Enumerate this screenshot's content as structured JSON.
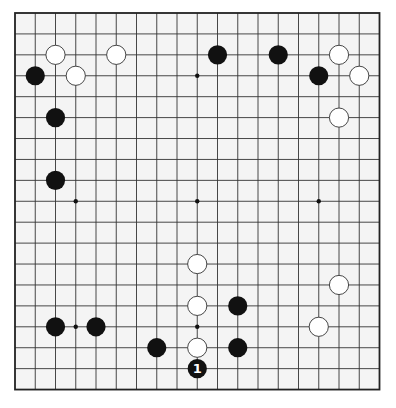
{
  "board": {
    "size": 19,
    "origin_x": 15,
    "origin_y": 13,
    "spacing_x": 20.25,
    "spacing_y": 20.92,
    "stone_radius": 9.6,
    "colors": {
      "background": "#f4f4f4",
      "line": "#333333",
      "border": "#222222",
      "black_stone": "#111111",
      "white_stone": "#ffffff",
      "white_outline": "#333333",
      "star_point": "#111111"
    },
    "star_points": [
      {
        "col": 3,
        "row": 3
      },
      {
        "col": 9,
        "row": 3
      },
      {
        "col": 15,
        "row": 3
      },
      {
        "col": 3,
        "row": 9
      },
      {
        "col": 9,
        "row": 9
      },
      {
        "col": 15,
        "row": 9
      },
      {
        "col": 3,
        "row": 15
      },
      {
        "col": 9,
        "row": 15
      },
      {
        "col": 15,
        "row": 15
      }
    ],
    "stones": [
      {
        "color": "white",
        "col": 2,
        "row": 2
      },
      {
        "color": "white",
        "col": 5,
        "row": 2
      },
      {
        "color": "white",
        "col": 3,
        "row": 3
      },
      {
        "color": "black",
        "col": 1,
        "row": 3
      },
      {
        "color": "black",
        "col": 2,
        "row": 5
      },
      {
        "color": "black",
        "col": 2,
        "row": 8
      },
      {
        "color": "black",
        "col": 10,
        "row": 2
      },
      {
        "color": "black",
        "col": 13,
        "row": 2
      },
      {
        "color": "black",
        "col": 15,
        "row": 3
      },
      {
        "color": "white",
        "col": 16,
        "row": 2
      },
      {
        "color": "white",
        "col": 17,
        "row": 3
      },
      {
        "color": "white",
        "col": 16,
        "row": 5
      },
      {
        "color": "white",
        "col": 9,
        "row": 12
      },
      {
        "color": "white",
        "col": 9,
        "row": 14
      },
      {
        "color": "black",
        "col": 11,
        "row": 14
      },
      {
        "color": "black",
        "col": 2,
        "row": 15
      },
      {
        "color": "black",
        "col": 4,
        "row": 15
      },
      {
        "color": "black",
        "col": 7,
        "row": 16
      },
      {
        "color": "white",
        "col": 9,
        "row": 16
      },
      {
        "color": "black",
        "col": 11,
        "row": 16
      },
      {
        "color": "white",
        "col": 16,
        "row": 13
      },
      {
        "color": "white",
        "col": 15,
        "row": 15
      },
      {
        "color": "black",
        "col": 9,
        "row": 17,
        "label": "1"
      }
    ]
  }
}
